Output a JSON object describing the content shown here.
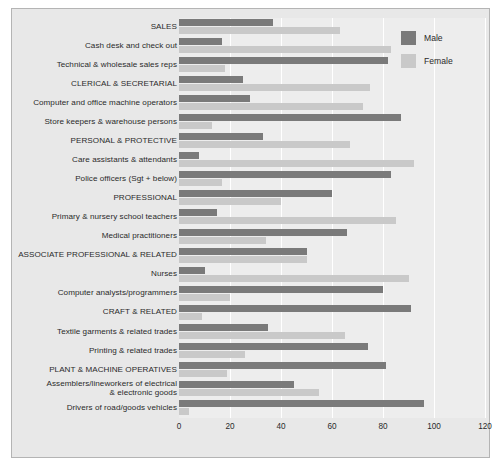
{
  "chart_data": {
    "type": "bar",
    "orientation": "horizontal",
    "grouping": "grouped",
    "title": "",
    "xlabel": "",
    "ylabel": "",
    "xlim": [
      0,
      120
    ],
    "xticks": [
      0,
      20,
      40,
      60,
      80,
      100,
      120
    ],
    "grid": true,
    "legend_position": "top-right",
    "categories": [
      "SALES",
      "Cash desk and check out",
      "Technical & wholesale sales reps",
      "CLERICAL & SECRETARIAL",
      "Computer and office machine operators",
      "Store keepers & warehouse persons",
      "PERSONAL & PROTECTIVE",
      "Care assistants & attendants",
      "Police officers (Sgt + below)",
      "PROFESSIONAL",
      "Primary & nursery school teachers",
      "Medical practitioners",
      "ASSOCIATE PROFESSIONAL & RELATED",
      "Nurses",
      "Computer analysts/programmers",
      "CRAFT & RELATED",
      "Textile garments & related trades",
      "Printing & related trades",
      "PLANT & MACHINE OPERATIVES",
      "Assemblers/lineworkers of electrical\n& electronic goods",
      "Drivers of road/goods vehicles"
    ],
    "series": [
      {
        "name": "Male",
        "color": "#7a7a7a",
        "values": [
          37,
          17,
          82,
          25,
          28,
          87,
          33,
          8,
          83,
          60,
          15,
          66,
          50,
          10,
          80,
          91,
          35,
          74,
          81,
          45,
          96
        ]
      },
      {
        "name": "Female",
        "color": "#c9c9c9",
        "values": [
          63,
          83,
          18,
          75,
          72,
          13,
          67,
          92,
          17,
          40,
          85,
          34,
          50,
          90,
          20,
          9,
          65,
          26,
          19,
          55,
          4
        ]
      }
    ]
  },
  "legend": {
    "items": [
      {
        "label": "Male",
        "color": "#7a7a7a"
      },
      {
        "label": "Female",
        "color": "#c9c9c9"
      }
    ]
  }
}
